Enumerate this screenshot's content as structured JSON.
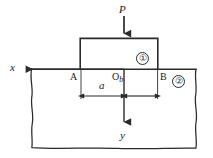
{
  "figure": {
    "labels": {
      "load": "P",
      "x_axis": "x",
      "y_axis": "y",
      "point_a": "A",
      "point_o": "O",
      "point_b": "B",
      "dim_a": "a",
      "dim_b": "b",
      "region_one": "①",
      "region_two": "②",
      "origin_subscript": "b"
    },
    "colors": {
      "line": "#2b2b2b",
      "text": "#1a1a1a",
      "background": "#ffffff"
    },
    "geometry": {
      "punch_left_x": 80,
      "punch_right_x": 158,
      "punch_top_y": 38,
      "surface_y": 69,
      "origin_x": 124,
      "dim_line_y": 96,
      "body_left_x": 31,
      "body_right_x": 196,
      "body_bottom_y": 148,
      "x_arrow_tip_x": 22,
      "y_arrow_tip_y": 127,
      "load_arrow_top_y": 16
    }
  }
}
